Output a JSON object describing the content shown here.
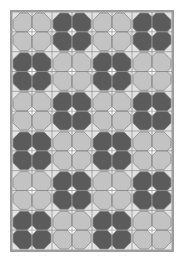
{
  "pattern": {
    "name": "four-petal flower tile quilt",
    "columns": 4,
    "rows": 6,
    "cells_per_motif": 2,
    "motifs": [
      [
        "light",
        "dark",
        "light",
        "dark"
      ],
      [
        "dark",
        "light",
        "dark",
        "light"
      ],
      [
        "light",
        "dark",
        "light",
        "dark"
      ],
      [
        "dark",
        "light",
        "dark",
        "light"
      ],
      [
        "light",
        "dark",
        "light",
        "dark"
      ],
      [
        "dark",
        "light",
        "dark",
        "light"
      ]
    ]
  },
  "colors": {
    "background": "#e2e2e2",
    "light_petal": "#c3c3c3",
    "dark_petal": "#5b5b5b",
    "grid_line": "#8a8a8a",
    "center": "#ffffff",
    "border": "#9c9c9c"
  }
}
